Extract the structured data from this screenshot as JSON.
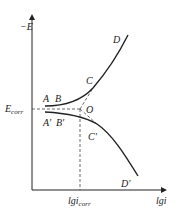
{
  "diagram": {
    "type": "polarization_curve",
    "y_axis_label": "−E",
    "x_axis_label": "lgi",
    "ecorr_label": {
      "main": "E",
      "sub": "corr"
    },
    "icorr_label": {
      "main": "lgi",
      "sub": "corr"
    },
    "points": {
      "A": "A",
      "B": "B",
      "C": "C",
      "D": "D",
      "A_prime": "A′",
      "B_prime": "B′",
      "C_prime": "C′",
      "D_prime": "D′",
      "O": "O"
    },
    "colors": {
      "line": "#222222",
      "dashed": "#444444"
    }
  }
}
